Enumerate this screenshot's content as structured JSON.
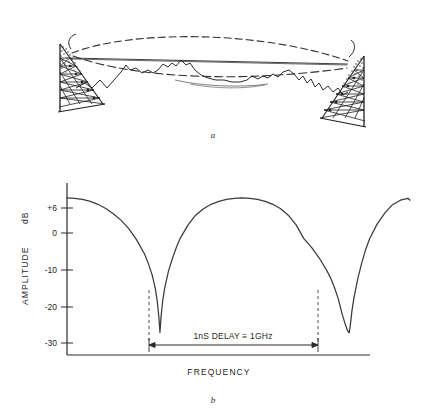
{
  "figure": {
    "panel_a": {
      "caption": "a",
      "description_elements": {
        "left_tower": "lattice-tower-left",
        "right_tower": "lattice-tower-right",
        "direct_ray": "direct-ray-path",
        "reflected_ray": "reflected-ray-path-dashed",
        "terrain": "terrain-profile"
      }
    },
    "panel_b": {
      "caption": "b"
    }
  },
  "chart_data": {
    "type": "line",
    "title": "",
    "xlabel": "FREQUENCY",
    "ylabel": "AMPLITUDE  dB",
    "ylabel_parts": [
      "AMPLITUDE",
      "dB"
    ],
    "ytick_labels": [
      "+6",
      "0",
      "-10",
      "-20",
      "-30"
    ],
    "ytick_values": [
      6,
      0,
      -10,
      -20,
      -30
    ],
    "ylim": [
      -36,
      10
    ],
    "xlim": [
      0,
      1
    ],
    "xtick_labels": [],
    "grid": false,
    "legend": null,
    "annotations": [
      {
        "name": "delay-span-annotation",
        "text": "1nS  DELAY ≡ 1GHz",
        "text_plain": "1nS DELAY = 1GHz",
        "type": "double-arrow-span",
        "from_x": 0.268,
        "to_x": 0.826,
        "at_y": -34
      },
      {
        "name": "null-marker-1",
        "type": "dashed-vertical",
        "x": 0.271,
        "y_from": -20,
        "y_to": -30
      },
      {
        "name": "null-marker-2",
        "type": "dashed-vertical",
        "x": 0.823,
        "y_from": -20,
        "y_to": -30
      }
    ],
    "series": [
      {
        "name": "multipath-fading-response",
        "color": "#3a3a3a",
        "comment": "Amplitude in dB vs frequency; deep nulls at the two marked frequencies, +6 dB peaks between.",
        "x": [
          0.0,
          0.022,
          0.045,
          0.068,
          0.09,
          0.113,
          0.135,
          0.158,
          0.18,
          0.203,
          0.214,
          0.226,
          0.237,
          0.248,
          0.257,
          0.263,
          0.268,
          0.271,
          0.274,
          0.279,
          0.285,
          0.296,
          0.308,
          0.319,
          0.33,
          0.353,
          0.375,
          0.398,
          0.42,
          0.443,
          0.465,
          0.488,
          0.51,
          0.533,
          0.555,
          0.578,
          0.6,
          0.623,
          0.645,
          0.668,
          0.69,
          0.713,
          0.735,
          0.758,
          0.769,
          0.78,
          0.791,
          0.802,
          0.812,
          0.818,
          0.822,
          0.823,
          0.826,
          0.831,
          0.837,
          0.848,
          0.859,
          0.87,
          0.882,
          0.904,
          0.927,
          0.949,
          0.972,
          0.994,
          1.0
        ],
        "y": [
          6.0,
          5.9,
          5.6,
          5.1,
          4.3,
          3.2,
          1.8,
          0.0,
          -2.2,
          -5.2,
          -7.0,
          -9.0,
          -11.5,
          -14.5,
          -18.0,
          -21.5,
          -26.0,
          -30.0,
          -26.0,
          -21.5,
          -18.0,
          -13.5,
          -10.0,
          -7.2,
          -4.8,
          -1.2,
          1.4,
          3.1,
          4.3,
          5.1,
          5.6,
          5.9,
          6.0,
          5.9,
          5.6,
          5.1,
          4.3,
          3.1,
          1.4,
          -1.2,
          -4.8,
          -7.2,
          -10.0,
          -13.5,
          -15.5,
          -18.0,
          -21.0,
          -25.0,
          -28.0,
          -29.5,
          -30.0,
          -30.0,
          -28.0,
          -24.0,
          -20.5,
          -15.5,
          -11.5,
          -8.0,
          -5.0,
          -1.0,
          2.0,
          4.2,
          5.4,
          5.9,
          5.4
        ]
      }
    ]
  }
}
